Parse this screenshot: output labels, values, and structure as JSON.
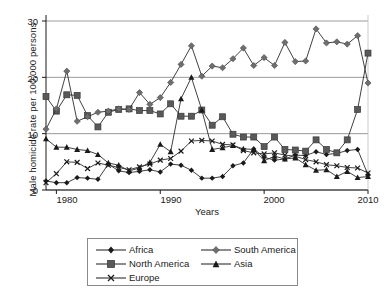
{
  "chart_data": {
    "type": "line",
    "title": "",
    "xlabel": "Years",
    "ylabel": "Male homicide rate per 100,000 persons",
    "xlim": [
      1979,
      2010
    ],
    "ylim": [
      0,
      30
    ],
    "yticks": [
      0,
      10,
      20,
      30
    ],
    "xticks": [
      1980,
      1990,
      2000,
      2010
    ],
    "grid": "horizontal",
    "legend_position": "bottom",
    "x": [
      1979,
      1980,
      1981,
      1982,
      1983,
      1984,
      1985,
      1986,
      1987,
      1988,
      1989,
      1990,
      1991,
      1992,
      1993,
      1994,
      1995,
      1996,
      1997,
      1998,
      1999,
      2000,
      2001,
      2002,
      2003,
      2004,
      2005,
      2006,
      2007,
      2008,
      2009,
      2010
    ],
    "series": [
      {
        "name": "Africa",
        "marker": "diamond",
        "color": "#1a1a1a",
        "values": [
          1.6,
          1.3,
          1.3,
          2.2,
          2.1,
          1.9,
          4.6,
          3.4,
          3.1,
          3.3,
          3.6,
          3.2,
          4.6,
          4.4,
          3.5,
          2.1,
          2.1,
          2.4,
          4.3,
          4.8,
          7.3,
          5.8,
          5.3,
          5.5,
          6.2,
          6.1,
          6.8,
          6.3,
          6.5,
          7.0,
          7.2,
          2.7
        ]
      },
      {
        "name": "North America",
        "marker": "square",
        "color": "#595959",
        "values": [
          16.6,
          14.0,
          16.9,
          16.8,
          13.2,
          11.2,
          13.8,
          14.3,
          14.4,
          14.1,
          14.1,
          13.5,
          15.3,
          13.1,
          13.1,
          14.2,
          11.5,
          13.0,
          9.9,
          9.4,
          9.4,
          7.7,
          9.4,
          7.2,
          7.1,
          6.9,
          8.9,
          7.2,
          6.6,
          8.9,
          14.3,
          24.3
        ]
      },
      {
        "name": "Europe",
        "marker": "x",
        "color": "#1a1a1a",
        "values": [
          1.3,
          2.9,
          5.0,
          4.9,
          3.8,
          4.8,
          4.4,
          4.0,
          3.6,
          4.1,
          4.6,
          5.3,
          5.6,
          6.9,
          8.7,
          8.8,
          8.7,
          8.1,
          8.0,
          7.0,
          6.6,
          6.4,
          6.6,
          6.2,
          6.0,
          5.4,
          5.0,
          4.5,
          4.3,
          4.0,
          3.9,
          3.0
        ]
      },
      {
        "name": "South America",
        "marker": "circle",
        "color": "#595959",
        "values": [
          10.8,
          14.4,
          21.1,
          12.2,
          13.0,
          13.8,
          14.0,
          14.4,
          14.3,
          17.3,
          15.2,
          16.4,
          19.1,
          22.3,
          25.6,
          20.2,
          22.0,
          21.7,
          23.3,
          25.2,
          22.1,
          23.5,
          22.1,
          26.2,
          22.8,
          22.9,
          28.6,
          26.1,
          26.3,
          25.9,
          27.4,
          19.0
        ]
      },
      {
        "name": "Asia",
        "marker": "triangle",
        "color": "#1a1a1a",
        "values": [
          9.1,
          7.6,
          7.6,
          7.2,
          7.0,
          6.3,
          4.8,
          4.4,
          3.4,
          3.9,
          4.9,
          8.1,
          6.8,
          16.2,
          20.0,
          14.2,
          7.2,
          7.5,
          7.9,
          7.3,
          7.2,
          5.2,
          6.0,
          5.5,
          5.7,
          4.5,
          3.5,
          3.6,
          2.4,
          3.3,
          2.2,
          2.4
        ]
      }
    ]
  },
  "legend": {
    "items": [
      {
        "label": "Africa"
      },
      {
        "label": "North America"
      },
      {
        "label": "Europe"
      },
      {
        "label": "South America"
      },
      {
        "label": "Asia"
      }
    ]
  },
  "axes": {
    "ylabel": "Male homicide rate per 100,000 persons",
    "xlabel": "Years",
    "ytick_labels": [
      "0",
      "10",
      "20",
      "30"
    ],
    "xtick_labels": [
      "1980",
      "1990",
      "2000",
      "2010"
    ]
  }
}
